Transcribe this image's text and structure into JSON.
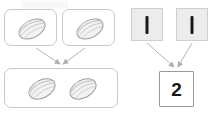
{
  "diagram": {
    "title": "",
    "background_color": "#ffffff",
    "left_group": {
      "name": "seed-addition-pictorial",
      "source_boxes": [
        {
          "id": "pod-box-a",
          "label": "",
          "item_count": 1,
          "item_icon": "cocoa-pod-icon",
          "fill_color": "#ffffff",
          "border_color": "#c9c9c9"
        },
        {
          "id": "pod-box-b",
          "label": "",
          "item_count": 1,
          "item_icon": "cocoa-pod-icon",
          "fill_color": "#ffffff",
          "border_color": "#c9c9c9"
        }
      ],
      "result_box": {
        "id": "pod-box-sum",
        "label": "",
        "item_count": 2,
        "item_icon": "cocoa-pod-icon",
        "fill_color": "#ffffff",
        "border_color": "#c9c9c9"
      },
      "arrows": [
        {
          "name": "arrow-pod-a-to-sum",
          "from": "pod-box-a",
          "to": "pod-box-sum"
        },
        {
          "name": "arrow-pod-b-to-sum",
          "from": "pod-box-b",
          "to": "pod-box-sum"
        }
      ]
    },
    "right_group": {
      "name": "tally-addition-symbolic",
      "source_boxes": [
        {
          "id": "tally-box-a",
          "value": "I",
          "icon": "tally-mark-icon",
          "fill_color": "#ececec",
          "border_color": "#cfcfcf"
        },
        {
          "id": "tally-box-b",
          "value": "I",
          "icon": "tally-mark-icon",
          "fill_color": "#ececec",
          "border_color": "#cfcfcf"
        }
      ],
      "result_box": {
        "id": "num-box-sum",
        "value": "2",
        "fill_color": "#ffffff",
        "border_color": "#9a9a9a"
      },
      "arrows": [
        {
          "name": "arrow-tally-a-to-sum",
          "from": "tally-box-a",
          "to": "num-box-sum"
        },
        {
          "name": "arrow-tally-b-to-sum",
          "from": "tally-box-b",
          "to": "num-box-sum"
        }
      ]
    },
    "colors": {
      "arrow_stroke": "#b5b5b5",
      "pod_outline": "#9b9b9b",
      "pod_fill": "#f2f2f2",
      "tally_mark": "#1a1a1a",
      "number_text": "#161616"
    }
  }
}
